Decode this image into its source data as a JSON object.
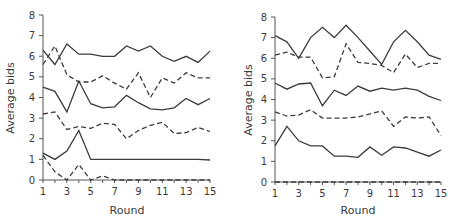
{
  "chart_data": [
    {
      "type": "line",
      "title": "",
      "xlabel": "Round",
      "ylabel": "Average bids",
      "xlim": [
        1,
        15
      ],
      "ylim": [
        0,
        8
      ],
      "xticks": [
        1,
        3,
        5,
        7,
        9,
        11,
        13,
        15
      ],
      "yticks": [
        0,
        1,
        2,
        3,
        4,
        5,
        6,
        7,
        8
      ],
      "grid": false,
      "legend": null,
      "x": [
        1,
        2,
        3,
        4,
        5,
        6,
        7,
        8,
        9,
        10,
        11,
        12,
        13,
        14,
        15
      ],
      "series": [
        {
          "name": "solid-top",
          "style": "solid",
          "values": [
            6.3,
            5.6,
            6.6,
            6.1,
            6.1,
            6.0,
            6.0,
            6.5,
            6.25,
            6.5,
            6.0,
            5.75,
            6.0,
            5.7,
            6.25
          ]
        },
        {
          "name": "dashed-upper",
          "style": "dashed",
          "values": [
            5.6,
            6.5,
            5.1,
            4.75,
            4.75,
            5.05,
            4.7,
            4.4,
            5.2,
            4.0,
            4.95,
            4.7,
            5.2,
            4.95,
            4.95
          ]
        },
        {
          "name": "solid-middle",
          "style": "solid",
          "values": [
            4.5,
            4.3,
            3.3,
            4.8,
            3.7,
            3.5,
            3.55,
            4.1,
            3.75,
            3.45,
            3.4,
            3.5,
            3.95,
            3.65,
            3.95
          ]
        },
        {
          "name": "dashed-middle",
          "style": "dashed",
          "values": [
            3.2,
            3.3,
            2.45,
            2.6,
            2.5,
            2.75,
            2.7,
            2.0,
            2.4,
            2.65,
            2.8,
            2.25,
            2.3,
            2.55,
            2.35
          ]
        },
        {
          "name": "solid-bottom",
          "style": "solid",
          "values": [
            1.3,
            1.0,
            1.4,
            2.4,
            1.0,
            1.0,
            1.0,
            1.0,
            1.0,
            1.0,
            1.0,
            1.0,
            1.0,
            1.0,
            0.97
          ]
        },
        {
          "name": "dashed-bottom",
          "style": "dashed",
          "values": [
            1.2,
            0.4,
            0.0,
            0.75,
            0.0,
            0.2,
            0.0,
            0.0,
            0.0,
            0.0,
            0.0,
            0.0,
            0.0,
            0.0,
            0.0
          ]
        }
      ]
    },
    {
      "type": "line",
      "title": "",
      "xlabel": "Round",
      "ylabel": "Average bids",
      "xlim": [
        1,
        15
      ],
      "ylim": [
        0,
        8
      ],
      "xticks": [
        1,
        3,
        5,
        7,
        9,
        11,
        13,
        15
      ],
      "yticks": [
        0,
        1,
        2,
        3,
        4,
        5,
        6,
        7,
        8
      ],
      "grid": false,
      "legend": null,
      "x": [
        1,
        2,
        3,
        4,
        5,
        6,
        7,
        8,
        9,
        10,
        11,
        12,
        13,
        14,
        15
      ],
      "series": [
        {
          "name": "solid-top",
          "style": "solid",
          "values": [
            7.1,
            6.8,
            6.0,
            7.0,
            7.5,
            7.0,
            7.6,
            7.0,
            6.35,
            5.7,
            6.8,
            7.35,
            6.8,
            6.15,
            5.95
          ]
        },
        {
          "name": "dashed-upper",
          "style": "dashed",
          "values": [
            6.15,
            6.3,
            6.05,
            6.05,
            5.05,
            5.1,
            6.7,
            5.8,
            5.75,
            5.65,
            5.3,
            6.2,
            5.55,
            5.75,
            5.75
          ]
        },
        {
          "name": "solid-middle",
          "style": "solid",
          "values": [
            4.8,
            4.5,
            4.75,
            4.8,
            3.7,
            4.45,
            4.2,
            4.65,
            4.4,
            4.55,
            4.45,
            4.55,
            4.45,
            4.15,
            3.95
          ]
        },
        {
          "name": "dashed-middle",
          "style": "dashed",
          "values": [
            3.4,
            3.2,
            3.25,
            3.5,
            3.1,
            3.1,
            3.1,
            3.15,
            3.3,
            3.45,
            2.7,
            3.15,
            3.1,
            3.15,
            2.25
          ]
        },
        {
          "name": "solid-bottom",
          "style": "solid",
          "values": [
            1.75,
            2.7,
            2.0,
            1.75,
            1.75,
            1.25,
            1.25,
            1.2,
            1.7,
            1.3,
            1.7,
            1.65,
            1.45,
            1.25,
            1.55
          ]
        },
        {
          "name": "dashed-bottom",
          "style": "dashed",
          "values": [
            0,
            0,
            0,
            0,
            0,
            0,
            0,
            0,
            0,
            0,
            0,
            0,
            0,
            0,
            0
          ]
        }
      ]
    }
  ],
  "panels": [
    {
      "ylabel": "Average bids",
      "xlabel": "Round"
    },
    {
      "ylabel": "Average bids",
      "xlabel": "Round"
    }
  ],
  "colors": {
    "line": "#3c3c3c",
    "axis": "#555555",
    "text": "#3a3a3a"
  }
}
